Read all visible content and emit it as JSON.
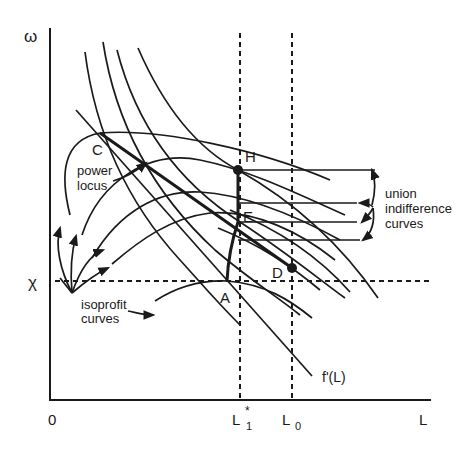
{
  "diagram": {
    "type": "economics-bargaining-diagram",
    "colors": {
      "ink": "#1a1a1a",
      "background": "#ffffff"
    },
    "axes": {
      "y_label": "ω",
      "x_label": "L",
      "origin_label": "0",
      "reference_wage_label": "χ",
      "x_ticks": [
        {
          "base": "L",
          "sub": "1",
          "sup": "*"
        },
        {
          "base": "L",
          "sub": "0",
          "sup": ""
        }
      ]
    },
    "points": {
      "A": "A",
      "C": "C",
      "D": "D",
      "E": "E",
      "H": "H"
    },
    "labels": {
      "labor_demand": "f'(L)",
      "power_locus_line1": "power",
      "power_locus_line2": "locus",
      "isoprofit_line1": "isoprofit",
      "isoprofit_line2": "curves",
      "union_line1": "union",
      "union_line2": "indifference",
      "union_line3": "curves"
    }
  }
}
